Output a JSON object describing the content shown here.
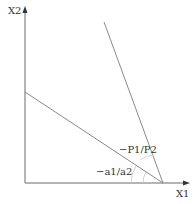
{
  "diagram": {
    "type": "budget-constraint-diagram",
    "axes": {
      "x_label": "X1",
      "y_label": "X2"
    },
    "lines": [
      {
        "name": "price-line",
        "slope_label": "−P1/P2",
        "from": [
          104,
          22
        ],
        "to": [
          163,
          183
        ]
      },
      {
        "name": "constraint-line",
        "slope_label": "−a1/a2",
        "from": [
          25,
          92
        ],
        "to": [
          163,
          183
        ]
      }
    ],
    "intersection": [
      163,
      183
    ],
    "colors": {
      "axis": "#555555",
      "line": "#8a8a8a",
      "arc": "#c8c8c8",
      "text": "#333333"
    }
  }
}
